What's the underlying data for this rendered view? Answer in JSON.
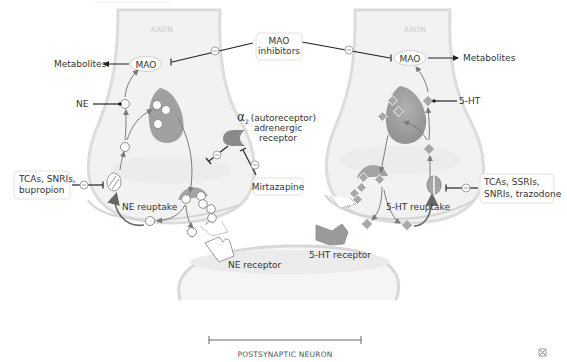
{
  "diagram": {
    "type": "synapse-mechanism",
    "labels": {
      "axon_left": "AXON",
      "axon_right": "AXON",
      "mao_left": "MAO",
      "mao_right": "MAO",
      "metabolites_left": "Metabolites",
      "metabolites_right": "Metabolites",
      "ne": "NE",
      "five_ht": "5-HT",
      "ne_reuptake": "NE reuptake",
      "five_ht_reuptake": "5-HT reuptake",
      "ne_receptor": "NE receptor",
      "five_ht_receptor": "5-HT receptor",
      "alpha_symbol": "α",
      "alpha_sub": "2",
      "alpha_line1": "(autoreceptor)",
      "alpha_line2": "adrenergic",
      "alpha_line3": "receptor",
      "postsynaptic": "POSTSYNAPTIC NEURON"
    },
    "drugs": {
      "mao_inhibitors_line1": "MAO",
      "mao_inhibitors_line2": "inhibitors",
      "left_line1": "TCAs, SNRIs,",
      "left_line2": "bupropion",
      "right_line1": "TCAs, SSRIs,",
      "right_line2": "SNRIs, trazodone",
      "mirtazapine": "Mirtazapine"
    },
    "inhibition_symbol": "–",
    "expand_icon": "expand-icon"
  }
}
